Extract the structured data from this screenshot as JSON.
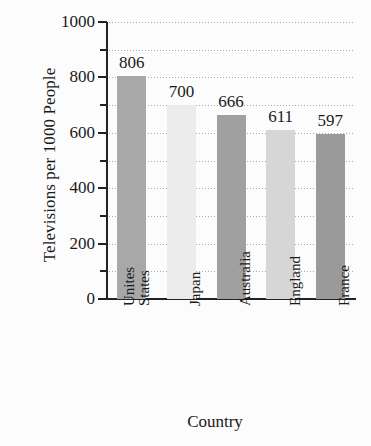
{
  "chart_data": {
    "type": "bar",
    "title": "",
    "xlabel": "Country",
    "ylabel": "Televisions per 1000 People",
    "categories": [
      "Unites States",
      "Japan",
      "Australia",
      "England",
      "France"
    ],
    "values": [
      806,
      700,
      666,
      611,
      597
    ],
    "value_labels": [
      "806",
      "700",
      "666",
      "611",
      "597"
    ],
    "ylim": [
      0,
      1000
    ],
    "ytick_labels": [
      "0",
      "200",
      "400",
      "600",
      "800",
      "1000"
    ],
    "ytick_values": [
      0,
      200,
      400,
      600,
      800,
      1000
    ],
    "minor_tick_interval": 100,
    "grid": true,
    "grid_style": "dotted",
    "legend": "none",
    "orientation": "vertical",
    "bar_colors": [
      "#a8a8a8",
      "#ececec",
      "#a0a0a0",
      "#d6d6d6",
      "#9a9a9a"
    ],
    "axis_color": "#222222",
    "grid_color": "#9b9b9b",
    "background_color": "#fcfcfc",
    "category_label_rotation": -90
  }
}
